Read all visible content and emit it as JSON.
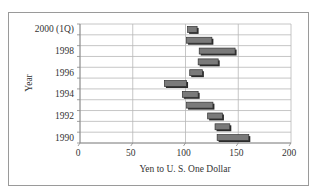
{
  "chart_data": {
    "type": "bar",
    "subtype": "floating-range-horizontal",
    "title": "",
    "xlabel": "Yen to U. S. One Dollar",
    "ylabel": "Year",
    "xlim": [
      0,
      200
    ],
    "xticks": [
      0,
      50,
      100,
      150,
      200
    ],
    "grid": true,
    "legend": null,
    "categories": [
      "1990",
      "1991",
      "1992",
      "1993",
      "1994",
      "1995",
      "1996",
      "1997",
      "1998",
      "1999",
      "2000 (1Q)"
    ],
    "ytick_labels": [
      "1990",
      "1992",
      "1994",
      "1996",
      "1998",
      "2000 (1Q)"
    ],
    "series": [
      {
        "name": "Low",
        "values": [
          130,
          128,
          121,
          101,
          97,
          80,
          104,
          112,
          113,
          101,
          102
        ]
      },
      {
        "name": "High",
        "values": [
          160,
          142,
          135,
          126,
          112,
          101,
          116,
          131,
          147,
          125,
          111
        ]
      }
    ],
    "bar_color": "#7a7a7a"
  },
  "axes": {
    "x_tick_labels": [
      "0",
      "50",
      "100",
      "150",
      "200"
    ],
    "x_title": "Yen to U. S. One Dollar",
    "y_title": "Year"
  }
}
